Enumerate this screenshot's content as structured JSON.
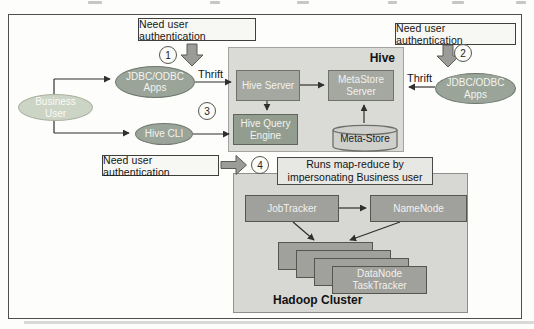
{
  "diagram_title": "Hive authentication architecture",
  "callouts": {
    "auth_top_left": "Need user authentication",
    "auth_top_right": "Need user authentication",
    "auth_bottom": "Need user authentication",
    "runs_line1": "Runs map-reduce by",
    "runs_line2": "impersonating Business user"
  },
  "steps": {
    "s1": "1",
    "s2": "2",
    "s3": "3",
    "s4": "4"
  },
  "edge_labels": {
    "thrift_left": "Thrift",
    "thrift_right": "Thrift"
  },
  "actors": {
    "business_user": "Business User",
    "jdbc_apps_left": "JDBC/ODBC Apps",
    "hive_cli": "Hive CLI",
    "jdbc_apps_right": "JDBC/ODBC Apps"
  },
  "hive": {
    "title": "Hive",
    "hive_server": "Hive Server",
    "metastore_server": "MetaStore Server",
    "hive_query_engine": "Hive Query Engine",
    "meta_store": "Meta-Store"
  },
  "hadoop": {
    "title": "Hadoop Cluster",
    "jobtracker": "JobTracker",
    "namenode": "NameNode",
    "datanode": "DataNode",
    "tasktracker": "TaskTracker"
  },
  "colors": {
    "ellipse_green": "#9aa499",
    "ellipse_pale_green": "#ccd4c5",
    "hive_container_gray": "#dadad7",
    "hive_node_gray": "#a4a8a1",
    "hive_query_engine_green": "#929d8f",
    "cylinder_gray": "#cfcfcc",
    "hadoop_container_gray": "#d7d7d4",
    "cluster_node_gray": "#a0a09c",
    "callout_bg": "#f7f7f4",
    "block_arrow_gray": "#9b9b98",
    "line_dark": "#2f2f2d"
  }
}
